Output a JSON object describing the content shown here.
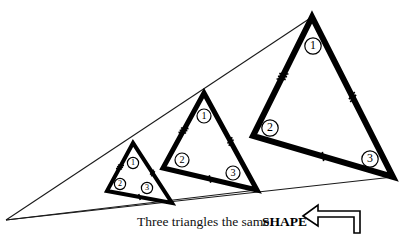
{
  "figure": {
    "title": "Three triangles the same SHAPE",
    "caption": {
      "plain": "Three triangles the same",
      "emphasis": "SHAPE",
      "arrow_icon": "left-arrow-outline"
    },
    "colors": {
      "stroke": "#000000",
      "background": "#ffffff",
      "thin_ray": "#1a1a1a"
    },
    "projection_point": {
      "x": 6,
      "y": 220
    },
    "rays": [
      {
        "name": "upper-ray",
        "from": [
          6,
          220
        ],
        "to": [
          312,
          17
        ]
      },
      {
        "name": "middle-ray",
        "from": [
          6,
          220
        ],
        "to": [
          393,
          177
        ]
      },
      {
        "name": "lower-ray",
        "from": [
          6,
          220
        ],
        "to": [
          257,
          190
        ]
      }
    ],
    "triangles": [
      {
        "name": "small-triangle",
        "size_label": "small",
        "stroke_width": 4,
        "vertices": {
          "apex": [
            133,
            143
          ],
          "left": [
            107,
            191
          ],
          "right": [
            172,
            203
          ]
        },
        "angle_labels": [
          {
            "id": "1",
            "x": 133,
            "y": 163
          },
          {
            "id": "2",
            "x": 120,
            "y": 184
          },
          {
            "id": "3",
            "x": 147,
            "y": 188
          }
        ],
        "tick_marks": [
          {
            "side": "left",
            "count": 3
          },
          {
            "side": "right",
            "count": 2
          },
          {
            "side": "base",
            "count": 1
          }
        ]
      },
      {
        "name": "medium-triangle",
        "size_label": "medium",
        "stroke_width": 5,
        "vertices": {
          "apex": [
            204,
            93
          ],
          "left": [
            163,
            168
          ],
          "right": [
            257,
            190
          ]
        },
        "angle_labels": [
          {
            "id": "1",
            "x": 204,
            "y": 116
          },
          {
            "id": "2",
            "x": 182,
            "y": 160
          },
          {
            "id": "3",
            "x": 233,
            "y": 173
          }
        ],
        "tick_marks": [
          {
            "side": "left",
            "count": 3
          },
          {
            "side": "right",
            "count": 2
          },
          {
            "side": "base",
            "count": 1
          }
        ]
      },
      {
        "name": "large-triangle",
        "size_label": "large",
        "stroke_width": 6,
        "vertices": {
          "apex": [
            312,
            17
          ],
          "left": [
            253,
            136
          ],
          "right": [
            393,
            177
          ]
        },
        "angle_labels": [
          {
            "id": "1",
            "x": 313,
            "y": 46
          },
          {
            "id": "2",
            "x": 270,
            "y": 128
          },
          {
            "id": "3",
            "x": 370,
            "y": 159
          }
        ],
        "tick_marks": [
          {
            "side": "left",
            "count": 3
          },
          {
            "side": "right",
            "count": 2
          },
          {
            "side": "base",
            "count": 1
          }
        ]
      }
    ]
  }
}
